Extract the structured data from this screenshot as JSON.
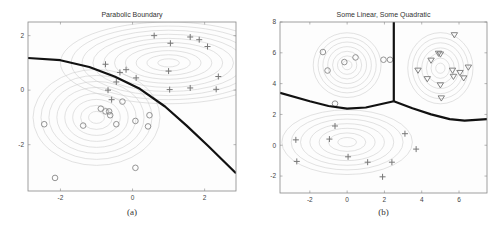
{
  "chart_data": [
    {
      "type": "scatter",
      "title": "Parabolic Boundary",
      "caption": "(a)",
      "xlabel": "",
      "ylabel": "",
      "xlim": [
        -2.9,
        2.87
      ],
      "ylim": [
        -3.7,
        2.5
      ],
      "xticks": [
        -2,
        0,
        2
      ],
      "yticks": [
        -2,
        0,
        2
      ],
      "grid": false,
      "legend": null,
      "series": [
        {
          "name": "class plus",
          "marker": "+",
          "points": [
            [
              0.6,
              2.0
            ],
            [
              1.05,
              1.72
            ],
            [
              1.6,
              1.95
            ],
            [
              1.85,
              1.85
            ],
            [
              2.08,
              1.6
            ],
            [
              -0.75,
              0.95
            ],
            [
              -0.35,
              0.65
            ],
            [
              -0.18,
              0.75
            ],
            [
              0.1,
              0.45
            ],
            [
              1.0,
              0.7
            ],
            [
              2.38,
              0.5
            ],
            [
              -0.45,
              0.3
            ],
            [
              -0.68,
              0.0
            ],
            [
              -0.58,
              -0.35
            ],
            [
              1.03,
              0.02
            ],
            [
              1.6,
              0.08
            ],
            [
              2.32,
              0.03
            ]
          ]
        },
        {
          "name": "class circle",
          "marker": "o",
          "points": [
            [
              -0.28,
              -0.42
            ],
            [
              -0.88,
              -0.68
            ],
            [
              -0.75,
              -0.78
            ],
            [
              -0.65,
              -0.78
            ],
            [
              -0.62,
              -0.92
            ],
            [
              0.47,
              -0.92
            ],
            [
              -2.45,
              -1.25
            ],
            [
              -1.37,
              -1.3
            ],
            [
              -0.45,
              -1.25
            ],
            [
              0.08,
              -1.13
            ],
            [
              0.43,
              -1.33
            ],
            [
              0.08,
              -2.85
            ],
            [
              -2.15,
              -3.22
            ]
          ]
        },
        {
          "name": "decision boundary",
          "type": "line",
          "points": [
            [
              -2.9,
              1.18
            ],
            [
              -2.0,
              1.1
            ],
            [
              -1.2,
              0.85
            ],
            [
              -0.5,
              0.5
            ],
            [
              0.2,
              0.05
            ],
            [
              0.9,
              -0.6
            ],
            [
              1.5,
              -1.3
            ],
            [
              2.1,
              -2.05
            ],
            [
              2.87,
              -3.05
            ]
          ]
        }
      ],
      "contours": [
        {
          "center": [
            1.0,
            1.0
          ],
          "rx_step": 0.3,
          "ry_step": 0.15,
          "levels": 10
        },
        {
          "center": [
            -1.0,
            -1.0
          ],
          "rx_step": 0.22,
          "ry_step": 0.22,
          "levels": 8
        }
      ]
    },
    {
      "type": "scatter",
      "title": "Some Linear, Some Quadratic",
      "caption": "(b)",
      "xlabel": "",
      "ylabel": "",
      "xlim": [
        -3.6,
        7.5
      ],
      "ylim": [
        -3.1,
        8
      ],
      "xticks": [
        -2,
        0,
        2,
        4,
        6
      ],
      "yticks": [
        -2,
        0,
        2,
        4,
        6,
        8
      ],
      "grid": false,
      "legend": null,
      "series": [
        {
          "name": "class circle",
          "marker": "o",
          "points": [
            [
              -1.3,
              6.05
            ],
            [
              -1.05,
              4.85
            ],
            [
              -0.15,
              5.4
            ],
            [
              0.45,
              5.7
            ],
            [
              1.95,
              5.55
            ],
            [
              2.3,
              5.55
            ],
            [
              -0.65,
              2.7
            ]
          ]
        },
        {
          "name": "class triangle",
          "marker": "v",
          "points": [
            [
              5.75,
              7.15
            ],
            [
              4.9,
              5.95
            ],
            [
              5.0,
              5.9
            ],
            [
              4.5,
              5.5
            ],
            [
              3.8,
              4.85
            ],
            [
              4.3,
              4.3
            ],
            [
              5.0,
              3.9
            ],
            [
              5.05,
              3.05
            ],
            [
              5.65,
              4.85
            ],
            [
              5.7,
              4.45
            ],
            [
              6.05,
              4.7
            ],
            [
              6.25,
              4.35
            ],
            [
              6.5,
              5.05
            ]
          ]
        },
        {
          "name": "class plus",
          "marker": "+",
          "points": [
            [
              -0.65,
              1.25
            ],
            [
              -2.75,
              0.35
            ],
            [
              -0.95,
              0.4
            ],
            [
              3.1,
              0.75
            ],
            [
              3.7,
              -0.25
            ],
            [
              -2.7,
              -1.05
            ],
            [
              0.05,
              -0.75
            ],
            [
              1.1,
              -1.1
            ],
            [
              2.4,
              -1.1
            ],
            [
              1.9,
              -2.05
            ]
          ]
        },
        {
          "name": "decision boundary left",
          "type": "line",
          "points": [
            [
              -3.6,
              3.4
            ],
            [
              -2.0,
              2.85
            ],
            [
              -1.0,
              2.55
            ],
            [
              0.0,
              2.38
            ],
            [
              1.0,
              2.45
            ],
            [
              2.5,
              2.85
            ]
          ]
        },
        {
          "name": "decision boundary vertical",
          "type": "line",
          "points": [
            [
              2.5,
              8.0
            ],
            [
              2.5,
              2.85
            ]
          ]
        },
        {
          "name": "decision boundary right",
          "type": "line",
          "points": [
            [
              2.5,
              2.85
            ],
            [
              3.5,
              2.4
            ],
            [
              4.5,
              2.0
            ],
            [
              5.5,
              1.7
            ],
            [
              6.3,
              1.6
            ],
            [
              7.5,
              1.7
            ]
          ]
        }
      ],
      "contours": [
        {
          "center": [
            0.0,
            5.2
          ],
          "rx_step": 0.26,
          "ry_step": 0.3,
          "levels": 7
        },
        {
          "center": [
            5.0,
            5.0
          ],
          "rx_step": 0.25,
          "ry_step": 0.33,
          "levels": 7
        },
        {
          "center": [
            0.0,
            0.2
          ],
          "rx_step": 0.5,
          "ry_step": 0.3,
          "levels": 7
        }
      ]
    }
  ],
  "figure": {
    "captions": [
      "(a)",
      "(b)"
    ],
    "titles": [
      "Parabolic Boundary",
      "Some Linear, Some Quadratic"
    ]
  }
}
